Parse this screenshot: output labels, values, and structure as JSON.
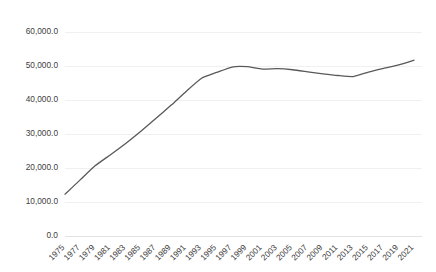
{
  "chart_data": {
    "type": "line",
    "title": "",
    "subtitle": "",
    "xlabel": "",
    "ylabel": "",
    "legend": [],
    "legend_position": "none",
    "grid": true,
    "grid_axis": "y",
    "line_color": "#595959",
    "background_color": "#ffffff",
    "gridline_color": "#f0f0f0",
    "tick_label_color": "#404040",
    "xlim": [
      1975,
      2021
    ],
    "ylim": [
      0.0,
      60000.0
    ],
    "ytick_labels": [
      "60,000.0",
      "50,000.0",
      "40,000.0",
      "30,000.0",
      "20,000.0",
      "10,000.0",
      "0.0"
    ],
    "ytick_values": [
      60000.0,
      50000.0,
      40000.0,
      30000.0,
      20000.0,
      10000.0,
      0.0
    ],
    "xtick_labels": [
      "1975",
      "1977",
      "1979",
      "1981",
      "1983",
      "1985",
      "1987",
      "1989",
      "1991",
      "1993",
      "1995",
      "1997",
      "1999",
      "2001",
      "2003",
      "2005",
      "2007",
      "2009",
      "2011",
      "2013",
      "2015",
      "2017",
      "2019",
      "2021"
    ],
    "xtick_rotation_deg": 45,
    "x": [
      1975,
      1977,
      1979,
      1981,
      1983,
      1985,
      1987,
      1989,
      1991,
      1993,
      1995,
      1997,
      1999,
      2001,
      2003,
      2005,
      2007,
      2009,
      2011,
      2013,
      2015,
      2017,
      2019,
      2021
    ],
    "values": [
      12300,
      16500,
      20700,
      23900,
      27200,
      30800,
      34600,
      38500,
      42600,
      46400,
      48100,
      49700,
      49800,
      49100,
      49200,
      48900,
      48300,
      47700,
      47200,
      46900,
      48200,
      49300,
      50300,
      51700
    ]
  }
}
